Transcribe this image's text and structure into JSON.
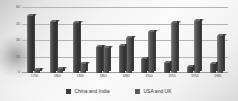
{
  "chart_data": {
    "type": "bar",
    "title": "",
    "subtitle": "",
    "xlabel": "",
    "ylabel": "",
    "ylim": [
      0,
      60
    ],
    "yticks": [
      0,
      15,
      30,
      45,
      60
    ],
    "ytick_labels": [
      "0",
      "15",
      "30",
      "45",
      "60"
    ],
    "grid": true,
    "legend_position": "bottom",
    "categories": [
      "1750",
      "1800",
      "1830",
      "1860",
      "1880",
      "1900",
      "1913",
      "1953",
      "1980"
    ],
    "series": [
      {
        "name": "China and India",
        "color": "#3a3a3a",
        "values": [
          53,
          47,
          46,
          24,
          25,
          13,
          9,
          6,
          8
        ]
      },
      {
        "name": "USA and UK",
        "color": "#5a5a5a",
        "values": [
          3,
          4,
          8,
          23,
          32,
          38,
          46,
          48,
          34
        ]
      }
    ]
  },
  "legend": {
    "items": [
      {
        "label": "China and India",
        "swatch": "#3a3a3a"
      },
      {
        "label": "USA and UK",
        "swatch": "#5a5a5a"
      }
    ]
  }
}
